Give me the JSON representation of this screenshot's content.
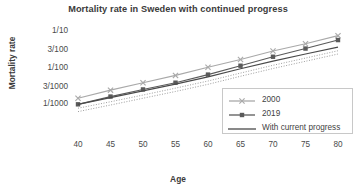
{
  "chart_data": {
    "type": "line",
    "title": "Mortality rate in Sweden with continued progress",
    "xlabel": "Age",
    "ylabel": "Mortality rate",
    "x": [
      40,
      45,
      50,
      55,
      60,
      65,
      70,
      75,
      80
    ],
    "xlim": [
      40,
      80
    ],
    "x_ticklabels": [
      "40",
      "45",
      "50",
      "55",
      "60",
      "65",
      "70",
      "75",
      "80"
    ],
    "yscale": "log",
    "ylim": [
      0.0006,
      0.13
    ],
    "y_ticks": [
      0.001,
      0.003,
      0.01,
      0.03,
      0.1
    ],
    "y_ticklabels": [
      "1/1000",
      "3/1000",
      "1/100",
      "3/100",
      "1/10"
    ],
    "grid": false,
    "legend_position": "lower right",
    "series": [
      {
        "name": "2000",
        "color": "#a9a9a9",
        "marker": "x",
        "linestyle": "solid",
        "values": [
          0.00135,
          0.00225,
          0.0036,
          0.0057,
          0.0095,
          0.0155,
          0.0265,
          0.042,
          0.07
        ]
      },
      {
        "name": "2019",
        "color": "#5a5a5a",
        "marker": "square",
        "linestyle": "solid",
        "values": [
          0.00092,
          0.0015,
          0.00235,
          0.0036,
          0.006,
          0.0105,
          0.0185,
          0.031,
          0.053
        ]
      },
      {
        "name": "With current progress",
        "color": "#4a4a4a",
        "marker": "none",
        "linestyle": "solid",
        "values": [
          0.00092,
          0.0014,
          0.00215,
          0.0033,
          0.0052,
          0.0087,
          0.014,
          0.022,
          0.034
        ]
      },
      {
        "name": "projection-upper",
        "color": "#9e9e9e",
        "marker": "none",
        "linestyle": "dotted",
        "values": [
          0.00072,
          0.00108,
          0.00165,
          0.00255,
          0.004,
          0.0066,
          0.0108,
          0.017,
          0.027
        ]
      },
      {
        "name": "projection-lower",
        "color": "#9e9e9e",
        "marker": "none",
        "linestyle": "dotted",
        "values": [
          0.00058,
          0.00088,
          0.00135,
          0.00207,
          0.00325,
          0.0054,
          0.0088,
          0.0139,
          0.022
        ]
      }
    ],
    "legend_entries": [
      {
        "label": "2000",
        "color": "#a9a9a9",
        "marker": "x",
        "linestyle": "solid"
      },
      {
        "label": "2019",
        "color": "#5a5a5a",
        "marker": "square",
        "linestyle": "solid"
      },
      {
        "label": "With current progress",
        "color": "#4a4a4a",
        "marker": "none",
        "linestyle": "solid"
      }
    ]
  }
}
